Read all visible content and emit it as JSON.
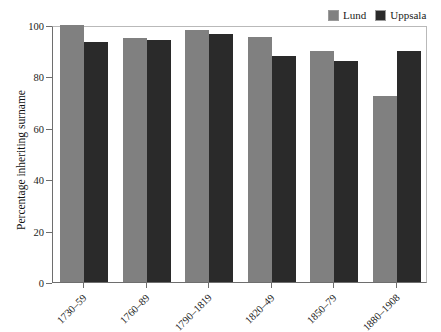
{
  "chart_data": {
    "type": "bar",
    "title": "",
    "xlabel": "",
    "ylabel": "Percentage inheriting surname",
    "ylim": [
      0,
      100
    ],
    "yticks": [
      0,
      20,
      40,
      60,
      80,
      100
    ],
    "grid": false,
    "legend_position": "top-right",
    "categories": [
      "1730–59",
      "1760–89",
      "1790–1819",
      "1820–49",
      "1850–79",
      "1880–1908"
    ],
    "series": [
      {
        "name": "Lund",
        "color": "#808080",
        "values": [
          100,
          95,
          98,
          95.5,
          90,
          72.5
        ]
      },
      {
        "name": "Uppsala",
        "color": "#2a2a2a",
        "values": [
          93.5,
          94,
          96.5,
          88,
          86,
          90
        ]
      }
    ]
  },
  "legend": {
    "entries": [
      {
        "label": "Lund",
        "color": "#808080"
      },
      {
        "label": "Uppsala",
        "color": "#2a2a2a"
      }
    ]
  },
  "axes": {
    "y_title": "Percentage inheriting surname",
    "y_tick_labels": [
      "100",
      "80",
      "60",
      "40",
      "20",
      "0"
    ],
    "x_tick_labels": [
      "1730–59",
      "1760–89",
      "1790–1819",
      "1820–49",
      "1850–79",
      "1880–1908"
    ]
  }
}
